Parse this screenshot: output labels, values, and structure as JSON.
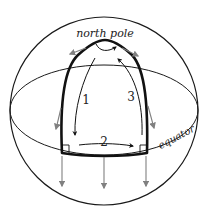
{
  "diagram": {
    "labels": {
      "north_pole": "north pole",
      "equator": "equator",
      "leg1": "1",
      "leg2": "2",
      "leg3": "3"
    },
    "colors": {
      "outline": "#1a1a1a",
      "path": "#111111",
      "vector": "#808080",
      "background": "#ffffff"
    },
    "path_legs": [
      {
        "id": "1",
        "description": "from north pole down to equator"
      },
      {
        "id": "2",
        "description": "along equator"
      },
      {
        "id": "3",
        "description": "from equator back up to north pole"
      }
    ]
  }
}
